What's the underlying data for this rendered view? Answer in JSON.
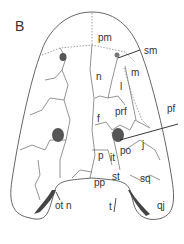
{
  "figure": {
    "panel_label": "B",
    "labels": {
      "pm": "pm",
      "sm": "sm",
      "n": "n",
      "m": "m",
      "l": "l",
      "prf": "prf",
      "f": "f",
      "pf": "pf",
      "p": "p",
      "it": "it",
      "po": "po",
      "j": "j",
      "pp": "pp",
      "st": "st",
      "sq": "sq",
      "otn": "ot n",
      "t": "t",
      "qj": "qj"
    },
    "colors": {
      "line": "#555555",
      "text": "#333333",
      "shade": "#444444"
    }
  }
}
